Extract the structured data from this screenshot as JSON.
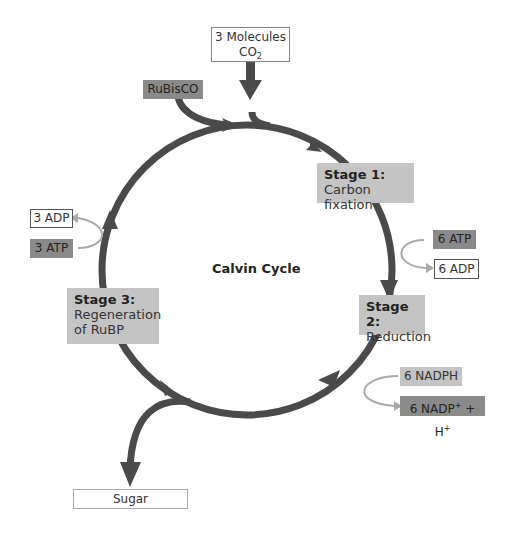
{
  "title": "Calvin Cycle",
  "inputs": {
    "co2": {
      "text": "3 Molecules",
      "formula": "CO",
      "subscript": "2"
    },
    "enzyme": "RuBisCO"
  },
  "stages": [
    {
      "heading": "Stage 1:",
      "lines": [
        "Carbon fixation"
      ]
    },
    {
      "heading": "Stage 2:",
      "lines": [
        "Reduction"
      ]
    },
    {
      "heading": "Stage 3:",
      "lines": [
        "Regeneration",
        "of RuBP"
      ]
    }
  ],
  "energy": {
    "stage1_in": "6 ATP",
    "stage1_out": "6 ADP",
    "stage2_in": "6 NADPH",
    "stage2_out_prefix": "6 NADP",
    "stage2_out_sup1": "+",
    "stage2_out_mid": " + H",
    "stage2_out_sup2": "+",
    "stage3_in": "3 ATP",
    "stage3_out": "3 ADP"
  },
  "output": "Sugar",
  "colors": {
    "ring": "#4a4a4a",
    "side_arrow": "#a9a9a9",
    "dark_box": "#8a8a8a",
    "light_box": "#c4c4c4"
  }
}
